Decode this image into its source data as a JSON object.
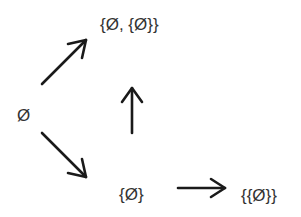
{
  "diagram": {
    "type": "directed-graph",
    "nodes": [
      {
        "id": "empty",
        "label": "Ø"
      },
      {
        "id": "pair",
        "label": "{Ø, {Ø}}"
      },
      {
        "id": "singleton",
        "label": "{Ø}"
      },
      {
        "id": "singleton_of_singleton",
        "label": "{{Ø}}"
      }
    ],
    "edges": [
      {
        "from": "empty",
        "to": "pair"
      },
      {
        "from": "empty",
        "to": "singleton"
      },
      {
        "from": "singleton",
        "to": "pair"
      },
      {
        "from": "singleton",
        "to": "singleton_of_singleton"
      }
    ],
    "colors": {
      "arrow": "#1a1a1a",
      "text": "#333333",
      "background": "#ffffff"
    }
  }
}
